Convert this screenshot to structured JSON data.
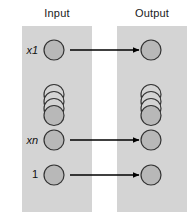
{
  "diagram": {
    "columns": [
      {
        "id": "input",
        "header": "Input"
      },
      {
        "id": "output",
        "header": "Output"
      }
    ],
    "node_labels": {
      "first": "x1",
      "nth": "xn",
      "bias": "1"
    },
    "nodes": {
      "input": [
        {
          "name": "input-node-x1",
          "label": "x1",
          "cx": 54,
          "cy": 50,
          "r": 10,
          "kind": "circle"
        },
        {
          "name": "input-node-stack",
          "label": "",
          "cx": 54,
          "cy": 105,
          "r": 10,
          "kind": "stack",
          "count": 4,
          "offset": 7
        },
        {
          "name": "input-node-xn",
          "label": "xn",
          "cx": 54,
          "cy": 140,
          "r": 10,
          "kind": "circle"
        },
        {
          "name": "input-node-bias",
          "label": "1",
          "cx": 54,
          "cy": 175,
          "r": 10,
          "kind": "circle"
        }
      ],
      "output": [
        {
          "name": "output-node-1",
          "label": "",
          "cx": 151,
          "cy": 50,
          "r": 10,
          "kind": "circle"
        },
        {
          "name": "output-node-stack",
          "label": "",
          "cx": 151,
          "cy": 105,
          "r": 10,
          "kind": "stack",
          "count": 4,
          "offset": 7
        },
        {
          "name": "output-node-n",
          "label": "",
          "cx": 151,
          "cy": 140,
          "r": 10,
          "kind": "circle"
        },
        {
          "name": "output-node-bias",
          "label": "",
          "cx": 151,
          "cy": 175,
          "r": 10,
          "kind": "circle"
        }
      ]
    },
    "connections": [
      {
        "name": "arrow-x1-to-output",
        "from": "input-node-x1",
        "to": "output-node-1",
        "x1": 70,
        "y1": 50,
        "x2": 139,
        "y2": 50
      },
      {
        "name": "arrow-xn-to-output",
        "from": "input-node-xn",
        "to": "output-node-n",
        "x1": 70,
        "y1": 140,
        "x2": 139,
        "y2": 140
      },
      {
        "name": "arrow-bias-to-output",
        "from": "input-node-bias",
        "to": "output-node-bias",
        "x1": 70,
        "y1": 175,
        "x2": 139,
        "y2": 175
      }
    ],
    "colors": {
      "panel_fill": "#d4d4d4",
      "node_fill": "#b8b8b8",
      "node_stroke": "#333333",
      "arrow": "#000000",
      "text": "#111111",
      "background": "#ffffff"
    }
  }
}
